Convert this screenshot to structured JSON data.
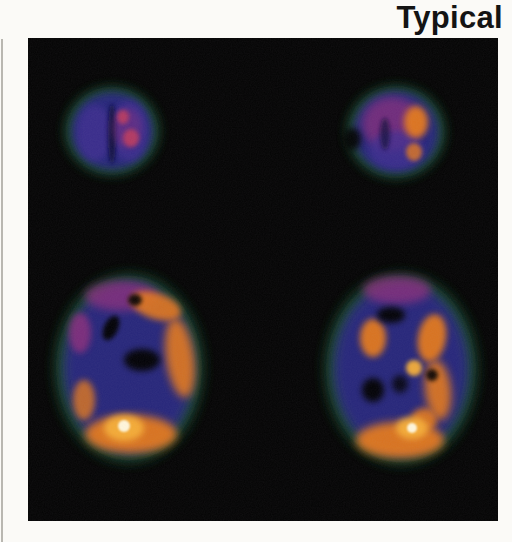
{
  "figure": {
    "label": "Typical",
    "content": "PET brain scan montage",
    "grid": {
      "rows": 2,
      "cols": 2
    }
  },
  "palette": {
    "page_bg": "#fbfaf7",
    "rule_gray": "#b9b7b1",
    "label_color": "#141414",
    "panel_black": "#030303",
    "fringe_green": "#1c5a2e",
    "deep_blue": "#26267a",
    "purple": "#3f2d91",
    "magenta": "#8e2e7c",
    "red_spot": "#bb3a5e",
    "orange": "#e2781e",
    "bright_orange": "#f5ae38",
    "hot_white": "#fff6da",
    "dark_shadow": "#0d0d38",
    "hole_black": "#000000",
    "grain_tint": "#8a7f92"
  }
}
